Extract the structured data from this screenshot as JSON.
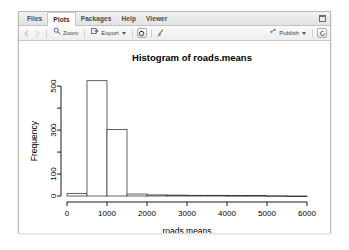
{
  "window": {
    "minimize_label": "minimize",
    "maximize_label": "maximize"
  },
  "tabs": [
    {
      "label": "Files",
      "active": false
    },
    {
      "label": "Plots",
      "active": true
    },
    {
      "label": "Packages",
      "active": false
    },
    {
      "label": "Help",
      "active": false
    },
    {
      "label": "Viewer",
      "active": false
    }
  ],
  "toolbar": {
    "back_label": "",
    "forward_label": "",
    "zoom_label": "Zoom",
    "export_label": "Export",
    "remove_label": "",
    "clear_all_label": "",
    "publish_label": "Publish",
    "refresh_label": ""
  },
  "chart_data": {
    "type": "bar",
    "title": "Histogram of roads.means",
    "xlabel": "roads.means",
    "ylabel": "Frequency",
    "xlim": [
      0,
      6250
    ],
    "ylim": [
      0,
      560
    ],
    "xticks": [
      0,
      1000,
      2000,
      3000,
      4000,
      5000,
      6000
    ],
    "xtick_labels": [
      "0",
      "1000",
      "2000",
      "3000",
      "4000",
      "5000",
      "6000"
    ],
    "yticks": [
      0,
      100,
      200,
      300,
      400,
      500
    ],
    "ytick_labels": [
      "0",
      "100",
      "",
      "300",
      "",
      "500"
    ],
    "grid": false,
    "legend": "none",
    "bin_width": 500,
    "bin_edges": [
      0,
      500,
      1000,
      1500,
      2000,
      2500,
      3000,
      3500,
      4000,
      4500,
      5000,
      5500,
      6000
    ],
    "categories": [
      "0-500",
      "500-1000",
      "1000-1500",
      "1500-2000",
      "2000-2500",
      "2500-3000",
      "3000-3500",
      "3500-4000",
      "4000-4500",
      "4500-5000",
      "5000-5500",
      "5500-6000"
    ],
    "values": [
      12,
      525,
      303,
      9,
      5,
      4,
      3,
      3,
      2,
      2,
      1,
      0
    ]
  }
}
